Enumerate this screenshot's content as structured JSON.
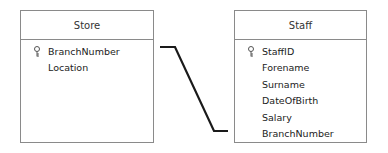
{
  "entities": [
    {
      "name": "Store",
      "fields": [
        {
          "label": "BranchNumber",
          "primary_key": true,
          "icon": "key-icon"
        },
        {
          "label": "Location",
          "primary_key": false
        }
      ]
    },
    {
      "name": "Staff",
      "fields": [
        {
          "label": "StaffID",
          "primary_key": true,
          "icon": "key-icon"
        },
        {
          "label": "Forename",
          "primary_key": false
        },
        {
          "label": "Surname",
          "primary_key": false
        },
        {
          "label": "DateOfBirth",
          "primary_key": false
        },
        {
          "label": "Salary",
          "primary_key": false
        },
        {
          "label": "BranchNumber",
          "primary_key": false
        }
      ]
    }
  ],
  "relationship": {
    "from": "Store.BranchNumber",
    "to": "Staff.BranchNumber",
    "color": "#1a1a1a"
  }
}
